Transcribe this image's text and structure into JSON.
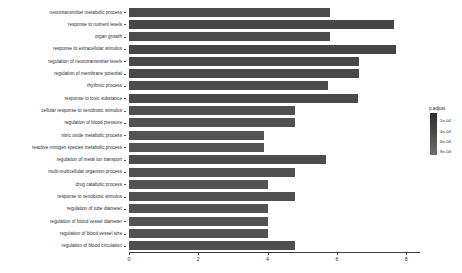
{
  "chart_data": {
    "type": "bar",
    "title": "",
    "xlabel": "",
    "ylabel": "",
    "orientation": "horizontal",
    "xlim": [
      0,
      8.4
    ],
    "grid": false,
    "categories": [
      "neurotransmitter metabolic process",
      "response to nutrient levels",
      "organ growth",
      "response to extracellular stimulus",
      "regulation of neurotransmitter levels",
      "regulation of membrane potential",
      "rhythmic process",
      "response to toxic substance",
      "cellular response to xenobiotic stimulus",
      "regulation of blood pressure",
      "nitric oxide metabolic process",
      "reactive nitrogen species metabolic process",
      "regulation of metal ion transport",
      "multi-multicellular organism process",
      "drug catabolic process",
      "response to xenobiotic stimulus",
      "regulation of tube diameter",
      "regulation of blood vessel diameter",
      "regulation of blood vessel size",
      "regulation of blood circulation"
    ],
    "values": [
      5.8,
      7.65,
      5.8,
      7.7,
      6.65,
      6.65,
      5.75,
      6.6,
      4.8,
      4.8,
      3.9,
      3.9,
      5.7,
      4.8,
      4.0,
      4.8,
      4.0,
      4.0,
      4.0,
      4.8
    ],
    "value_label": "Count",
    "xticks": [
      0,
      2,
      4,
      6,
      8
    ],
    "xtick_labels": [
      "0",
      "2",
      "4",
      "6",
      "8"
    ],
    "bar_colors": [
      "#4b4b4b",
      "#464646",
      "#4b4b4b",
      "#464646",
      "#484848",
      "#484848",
      "#4c4c4c",
      "#494949",
      "#505050",
      "#505050",
      "#545454",
      "#545454",
      "#4c4c4c",
      "#505050",
      "#525252",
      "#505050",
      "#525252",
      "#525252",
      "#525252",
      "#4f4f4f"
    ]
  },
  "legend": {
    "title": "p.adjust",
    "ticks": [
      {
        "label": "2e-04",
        "pos": 0.17
      },
      {
        "label": "4e-04",
        "pos": 0.42
      },
      {
        "label": "6e-04",
        "pos": 0.67
      },
      {
        "label": "8e-04",
        "pos": 0.9
      }
    ],
    "gradient_top_color": "#2d2d2d",
    "gradient_bottom_color": "#6e6e6e"
  }
}
